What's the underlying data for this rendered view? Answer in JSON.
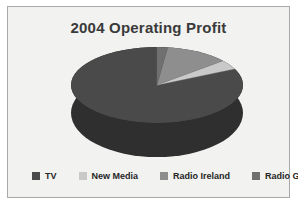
{
  "chart_data": {
    "type": "pie",
    "title": "2004 Operating Profit",
    "xlabel": "",
    "ylabel": "",
    "categories": [
      "TV",
      "New Media",
      "Radio Ireland",
      "Radio GB"
    ],
    "values": [
      82,
      4,
      12,
      2
    ],
    "colors": [
      "#4a4a4a",
      "#c9c9c9",
      "#8e8e8e",
      "#707070"
    ],
    "legend_position": "bottom",
    "grid": false,
    "three_d": true,
    "slices": [
      {
        "label": "TV",
        "value": 82,
        "color": "#4a4a4a"
      },
      {
        "label": "New Media",
        "value": 4,
        "color": "#c9c9c9"
      },
      {
        "label": "Radio Ireland",
        "value": 12,
        "color": "#8e8e8e"
      },
      {
        "label": "Radio GB",
        "value": 2,
        "color": "#707070"
      }
    ]
  },
  "figure": {
    "title": "2004 Operating Profit",
    "side_color": "#2f2f2f",
    "frame_color": "#a9a9a9",
    "background": "#f2f2f0"
  },
  "legend": {
    "items": [
      {
        "label": "TV",
        "color": "#4a4a4a"
      },
      {
        "label": "New Media",
        "color": "#c9c9c9"
      },
      {
        "label": "Radio Ireland",
        "color": "#8e8e8e"
      },
      {
        "label": "Radio GB",
        "color": "#707070"
      }
    ]
  }
}
